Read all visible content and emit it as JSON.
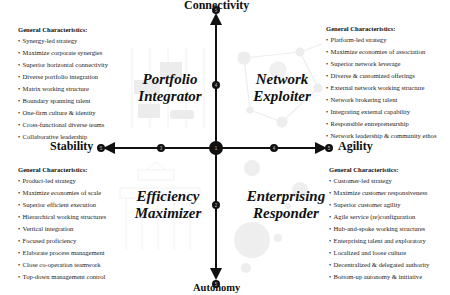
{
  "axes": {
    "top": "Connectivity",
    "bottom": "Autonomy",
    "left": "Stability",
    "right": "Agility"
  },
  "nodes": {
    "center": "1",
    "bottom_inner": "2",
    "left_inner": "3",
    "right_inner": "4",
    "top_inner": "4",
    "top_end": "5",
    "bottom_end": "5",
    "left_end": "5",
    "right_end": "5"
  },
  "quadrants": {
    "top_left": {
      "title_line1": "Portfolio",
      "title_line2": "Integrator",
      "heading": "General Characteristics:",
      "items": [
        "Synergy-led strategy",
        "Maximize corporate synergies",
        "Superior horizontal connectivity",
        "Diverse portfolio integration",
        "Matrix working structure",
        "Boundary spanning talent",
        "One-firm culture & identity",
        "Cross-functional diverse teams",
        "Collaborative leadership"
      ]
    },
    "top_right": {
      "title_line1": "Network",
      "title_line2": "Exploiter",
      "heading": "General Characteristics:",
      "items": [
        "Platform-led strategy",
        "Maximize economies of association",
        "Superior network leverage",
        "Diverse & customized offerings",
        "External network working structure",
        "Network brokering talent",
        "Integrating external capability",
        "Responsible entrepreneurship",
        "Network leadership & community ethos"
      ]
    },
    "bottom_left": {
      "title_line1": "Efficiency",
      "title_line2": "Maximizer",
      "heading": "General Characteristics:",
      "items": [
        "Product-led strategy",
        "Maximize economies of scale",
        "Superior efficient execution",
        "Hierarchical working structures",
        "Vertical integration",
        "Focused proficiency",
        "Elaborate process management",
        "Close co-operation teamwork",
        "Top-down management control"
      ]
    },
    "bottom_right": {
      "title_line1": "Enterprising",
      "title_line2": "Responder",
      "heading": "General Characteristics:",
      "items": [
        "Customer-led strategy",
        "Maximize customer responsiveness",
        "Superior customer agility",
        "Agile service (re)configuration",
        "Hub-and-spoke working structures",
        "Enterprising talent and exploratory",
        "Localized and loose culture",
        "Decentralized & delegated authority",
        "Bottom-up autonomy & initiative"
      ]
    }
  },
  "colors": {
    "axis": "#111111",
    "background_art": "#e6e6e6"
  }
}
